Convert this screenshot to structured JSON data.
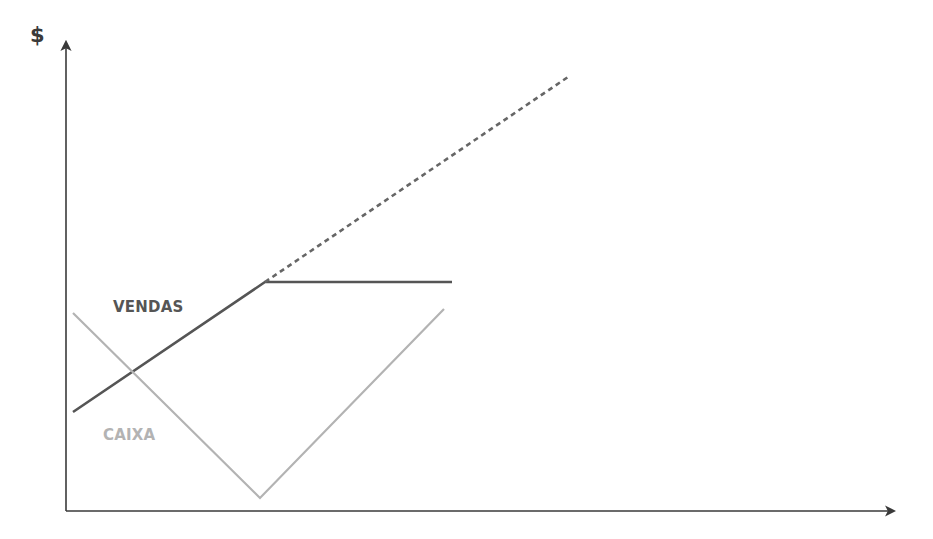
{
  "chart_data": {
    "type": "line",
    "title": "",
    "xlabel": "",
    "ylabel": "$",
    "grid": false,
    "legend": "inline labels",
    "note": "Conceptual chart without numeric ticks; coordinates are pixel-space readings (origin at axes corner, y up).",
    "axes": {
      "origin_px": [
        66,
        511
      ],
      "x_end_px": [
        896,
        511
      ],
      "y_end_px": [
        66,
        40
      ]
    },
    "series": [
      {
        "name": "VENDAS",
        "label": "VENDAS",
        "color": "#555555",
        "style": "solid",
        "points_px": [
          [
            73,
            412
          ],
          [
            265,
            282
          ],
          [
            452,
            282
          ]
        ]
      },
      {
        "name": "VENDAS (projeção)",
        "label": "",
        "color": "#666666",
        "style": "dashed",
        "points_px": [
          [
            265,
            282
          ],
          [
            568,
            77
          ]
        ]
      },
      {
        "name": "CAIXA",
        "label": "CAIXA",
        "color": "#b3b3b3",
        "style": "solid",
        "points_px": [
          [
            73,
            313
          ],
          [
            260,
            498
          ],
          [
            444,
            309
          ]
        ]
      }
    ],
    "annotations": [
      "$",
      "VENDAS",
      "CAIXA"
    ]
  },
  "labels": {
    "y_axis": "$",
    "vendas": "VENDAS",
    "caixa": "CAIXA"
  },
  "colors": {
    "axis": "#3a3a3a",
    "vendas": "#555555",
    "vendas_dashed": "#666666",
    "caixa": "#b3b3b3"
  }
}
